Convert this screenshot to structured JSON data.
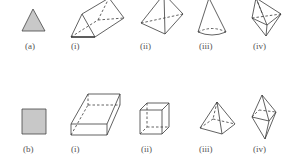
{
  "figure": {
    "stroke_color": "#333333",
    "fill_color": "#cccccc",
    "row_a": {
      "base_label": "(a)",
      "base_shape": "triangle",
      "items": [
        {
          "label": "(i)",
          "shape": "triangular-prism"
        },
        {
          "label": "(ii)",
          "shape": "triangular-pyramid"
        },
        {
          "label": "(iii)",
          "shape": "cone"
        },
        {
          "label": "(iv)",
          "shape": "triangular-bipyramid"
        }
      ]
    },
    "row_b": {
      "base_label": "(b)",
      "base_shape": "square",
      "items": [
        {
          "label": "(i)",
          "shape": "rectangular-box"
        },
        {
          "label": "(ii)",
          "shape": "cube"
        },
        {
          "label": "(iii)",
          "shape": "square-pyramid"
        },
        {
          "label": "(iv)",
          "shape": "square-bipyramid"
        }
      ]
    }
  }
}
